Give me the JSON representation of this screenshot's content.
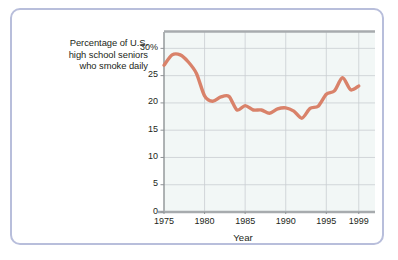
{
  "figure": {
    "border_color": "#b8bedb",
    "background": "#ffffff"
  },
  "axis_title": {
    "lines": [
      "Percentage of U.S.",
      "high school seniors",
      "who smoke daily"
    ]
  },
  "chart_data": {
    "type": "line",
    "title": "Percentage of U.S. high school seniors who smoke daily",
    "xlabel": "Year",
    "ylabel": "Percentage of U.S. high school seniors who smoke daily",
    "xlim": [
      1975,
      2001
    ],
    "ylim": [
      0,
      33
    ],
    "grid": true,
    "legend": "none",
    "plot_background": "#f2f7f6",
    "gridline_color": "#c9ced2",
    "axis_color": "#939699",
    "line_color": "#d9826a",
    "line_width": 3.4,
    "xticks": [
      1975,
      1980,
      1985,
      1990,
      1995,
      1999
    ],
    "xtick_labels": [
      "1975",
      "1980",
      "1985",
      "1990",
      "1995",
      "1999"
    ],
    "yticks": [
      0,
      5,
      10,
      15,
      20,
      25,
      30
    ],
    "ytick_labels": [
      "0",
      "5",
      "10",
      "15",
      "20",
      "25",
      "30%"
    ],
    "x": [
      1975,
      1976,
      1977,
      1978,
      1979,
      1980,
      1981,
      1982,
      1983,
      1984,
      1985,
      1986,
      1987,
      1988,
      1989,
      1990,
      1991,
      1992,
      1993,
      1994,
      1995,
      1996,
      1997,
      1998,
      1999
    ],
    "values": [
      26.9,
      28.8,
      28.8,
      27.5,
      25.4,
      21.3,
      20.3,
      21.1,
      21.2,
      18.7,
      19.5,
      18.7,
      18.7,
      18.1,
      18.9,
      19.1,
      18.5,
      17.2,
      19.0,
      19.4,
      21.6,
      22.2,
      24.6,
      22.4,
      23.1
    ],
    "series": [
      {
        "name": "Daily smoking rate",
        "values": [
          26.9,
          28.8,
          28.8,
          27.5,
          25.4,
          21.3,
          20.3,
          21.1,
          21.2,
          18.7,
          19.5,
          18.7,
          18.7,
          18.1,
          18.9,
          19.1,
          18.5,
          17.2,
          19.0,
          19.4,
          21.6,
          22.2,
          24.6,
          22.4,
          23.1
        ]
      }
    ]
  }
}
